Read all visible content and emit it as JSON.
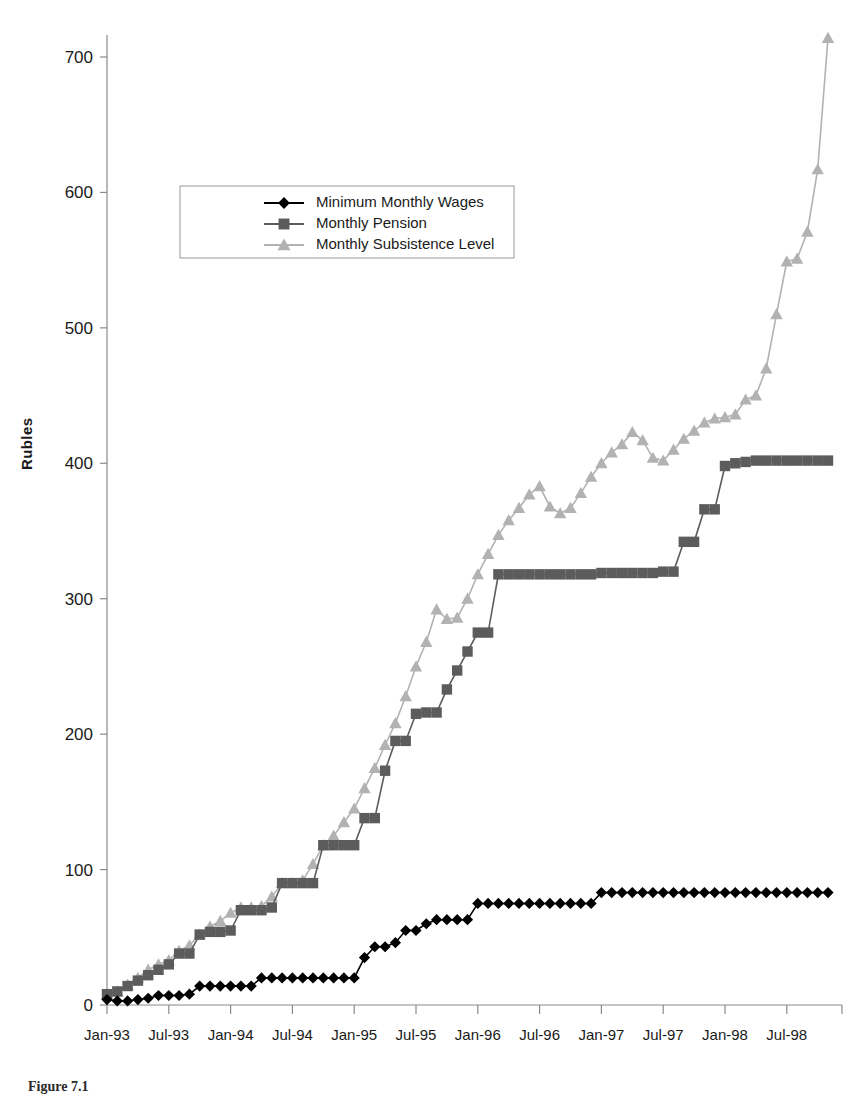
{
  "figure": {
    "caption": "Figure 7.1"
  },
  "chart_data": {
    "type": "line",
    "title": "",
    "xlabel": "",
    "ylabel": "Rubles",
    "ylim": [
      0,
      700
    ],
    "yticks": [
      0,
      100,
      200,
      300,
      400,
      500,
      600,
      700
    ],
    "ytick_labels": [
      "0",
      "100",
      "200",
      "300",
      "400",
      "500",
      "600",
      "700"
    ],
    "xtick_labels": [
      "Jan-93",
      "Jul-93",
      "Jan-94",
      "Jul-94",
      "Jan-95",
      "Jul-95",
      "Jan-96",
      "Jul-96",
      "Jan-97",
      "Jul-97",
      "Jan-98",
      "Jul-98"
    ],
    "xtick_indices": [
      0,
      6,
      12,
      18,
      24,
      30,
      36,
      42,
      48,
      54,
      60,
      66
    ],
    "x_count": 71,
    "grid": false,
    "legend_position": "upper-left-inset",
    "series": [
      {
        "name": "Minimum Monthly Wages",
        "marker": "diamond",
        "color": "#000000",
        "values": [
          4,
          3,
          3,
          4,
          5,
          7,
          7,
          7,
          8,
          14,
          14,
          14,
          14,
          14,
          14,
          20,
          20,
          20,
          20,
          20,
          20,
          20,
          20,
          20,
          20,
          35,
          43,
          43,
          46,
          55,
          55,
          60,
          63,
          63,
          63,
          63,
          75,
          75,
          75,
          75,
          75,
          75,
          75,
          75,
          75,
          75,
          75,
          75,
          83,
          83,
          83,
          83,
          83,
          83,
          83,
          83,
          83,
          83,
          83,
          83,
          83,
          83,
          83,
          83,
          83,
          83,
          83,
          83,
          83,
          83,
          83
        ]
      },
      {
        "name": "Monthly Pension",
        "marker": "square",
        "color": "#5c5c5c",
        "values": [
          8,
          10,
          14,
          18,
          22,
          26,
          30,
          38,
          38,
          52,
          54,
          54,
          55,
          70,
          70,
          70,
          72,
          90,
          90,
          90,
          90,
          118,
          118,
          118,
          118,
          138,
          138,
          173,
          195,
          195,
          215,
          216,
          216,
          233,
          247,
          261,
          275,
          275,
          318,
          318,
          318,
          318,
          318,
          318,
          318,
          318,
          318,
          318,
          319,
          319,
          319,
          319,
          319,
          319,
          320,
          320,
          342,
          342,
          366,
          366,
          398,
          400,
          401,
          402,
          402,
          402,
          402,
          402,
          402,
          402,
          402
        ]
      },
      {
        "name": "Monthly Subsistence Level",
        "marker": "triangle",
        "color": "#b2b2b2",
        "values": [
          8,
          10,
          15,
          20,
          26,
          30,
          33,
          40,
          44,
          52,
          58,
          62,
          68,
          72,
          72,
          73,
          80,
          90,
          90,
          92,
          104,
          118,
          125,
          135,
          145,
          160,
          175,
          192,
          208,
          228,
          250,
          268,
          292,
          285,
          286,
          300,
          318,
          333,
          347,
          358,
          367,
          377,
          383,
          368,
          363,
          367,
          378,
          390,
          400,
          408,
          414,
          423,
          417,
          404,
          402,
          410,
          418,
          424,
          430,
          433,
          434,
          436,
          447,
          450,
          470,
          510,
          549,
          551,
          571,
          617,
          714
        ]
      }
    ]
  },
  "legend": {
    "entries": [
      {
        "label": "Minimum Monthly Wages"
      },
      {
        "label": "Monthly Pension"
      },
      {
        "label": "Monthly Subsistence Level"
      }
    ]
  }
}
